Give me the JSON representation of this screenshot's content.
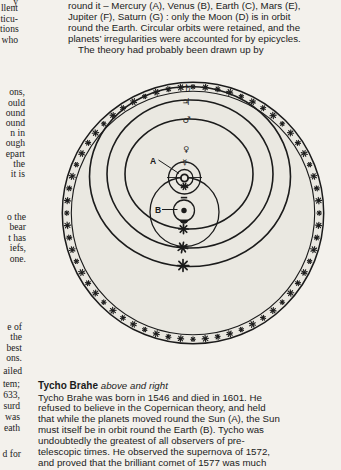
{
  "page": {
    "background": "#f3f1ec",
    "sphere_fill": "#eae8e1",
    "ink": "#1b1b1b"
  },
  "left_column_fragments": [
    "y",
    "llent",
    "ticu-",
    "tions",
    "who",
    "ons,",
    "ould",
    "ound",
    "ound",
    "n in",
    "ough",
    "epart",
    "the",
    "it is",
    "o the",
    "bear",
    "t has",
    "iefs,",
    "one.",
    "e of",
    "the",
    "best",
    "ons.",
    "ailed",
    "tem;",
    "633,",
    "surd",
    "was",
    "eath",
    "d for"
  ],
  "intro": {
    "lines": [
      "round it – Mercury (A), Venus (B), Earth (C), Mars (E),",
      "Jupiter (F), Saturn (G) : only the Moon (D) is in orbit",
      "round the Earth. Circular orbits were retained, and the",
      "planets’ irregularities were accounted for by epicycles.",
      "The theory had probably been drawn up by"
    ]
  },
  "diagram": {
    "label_sun": "A",
    "label_earth": "B",
    "symbols": {
      "saturn": "♄",
      "jupiter": "♃",
      "mars": "♂",
      "venus": "♀",
      "mercury": "☿"
    },
    "rim_star_count": 64
  },
  "caption": {
    "title": "Tycho Brahe",
    "subtitle": "above and right",
    "lines": [
      "Tycho Brahe was born in 1546 and died in 1601. He",
      "refused to believe in the Copernican theory, and held",
      "that while the planets moved round the Sun (A), the Sun",
      "must itself be in orbit round the Earth (B). Tycho was",
      "undoubtedly the greatest of all observers of pre-",
      "telescopic times. He observed the supernova of 1572,",
      "and proved that the brilliant comet of 1577 was much"
    ]
  }
}
